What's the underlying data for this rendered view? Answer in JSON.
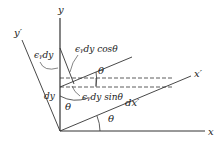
{
  "diagram": {
    "type": "strain-transformation",
    "axes": {
      "x": "x",
      "y": "y",
      "x_prime": "x′",
      "y_prime": "y′"
    },
    "labels": {
      "eps_dy": "ϵᵧdy",
      "eps_dy_cos": "ϵᵧdy cosθ",
      "eps_dy_sin": "ϵᵧdy sinθ",
      "dy": "dy",
      "dx_prime": "dx′",
      "theta_top": "θ",
      "theta_mid": "θ",
      "theta_bottom": "θ"
    },
    "colors": {
      "line": "#333333",
      "text": "#222222"
    }
  }
}
